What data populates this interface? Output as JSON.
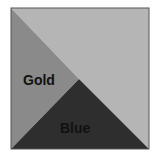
{
  "diagram": {
    "square": {
      "x": 11,
      "y": 8,
      "width": 138,
      "height": 141,
      "border_color": "#555555"
    },
    "apex": {
      "x": 79,
      "y": 79
    },
    "regions": [
      {
        "id": "top-right",
        "label": "",
        "color": "#b5b5b5",
        "points": "11,8 149,8 149,149 79,79"
      },
      {
        "id": "gold",
        "label": "Gold",
        "color": "#8a8a8a",
        "points": "11,8 79,79 11,149",
        "label_pos": {
          "x": 23,
          "y": 85
        }
      },
      {
        "id": "blue",
        "label": "Blue",
        "color": "#2e2e2e",
        "points": "11,149 79,79 149,149",
        "label_pos": {
          "x": 60,
          "y": 133
        }
      }
    ]
  }
}
